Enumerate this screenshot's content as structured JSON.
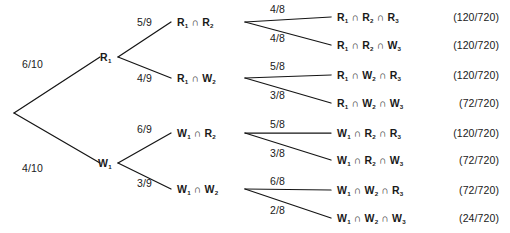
{
  "diagram": {
    "type": "probability-tree",
    "root": {
      "x": 14,
      "y": 113
    },
    "level1": [
      {
        "id": "R1",
        "label": "R",
        "subscript": "1",
        "prob": "6/10",
        "x": 100,
        "y": 57,
        "vertex_x": 118,
        "vertex_y": 57,
        "prob_x": 22,
        "prob_y": 64
      },
      {
        "id": "W1",
        "label": "W",
        "subscript": "1",
        "prob": "4/10",
        "x": 98,
        "y": 163,
        "vertex_x": 118,
        "vertex_y": 163,
        "prob_x": 22,
        "prob_y": 168
      }
    ],
    "level2": [
      {
        "id": "R1R2",
        "parent": "R1",
        "prob": "5/9",
        "prob_x": 137,
        "prob_y": 17,
        "x": 177,
        "y": 22,
        "vertex_x": 245,
        "vertex_y": 22,
        "terms": [
          {
            "letter": "R",
            "sub": "1"
          },
          {
            "letter": "R",
            "sub": "2"
          }
        ]
      },
      {
        "id": "R1W2",
        "parent": "R1",
        "prob": "4/9",
        "prob_x": 137,
        "prob_y": 73,
        "x": 177,
        "y": 78,
        "vertex_x": 245,
        "vertex_y": 78,
        "terms": [
          {
            "letter": "R",
            "sub": "1"
          },
          {
            "letter": "W",
            "sub": "2"
          }
        ]
      },
      {
        "id": "W1R2",
        "parent": "W1",
        "prob": "6/9",
        "prob_x": 137,
        "prob_y": 124,
        "x": 177,
        "y": 133,
        "vertex_x": 245,
        "vertex_y": 133,
        "terms": [
          {
            "letter": "W",
            "sub": "1"
          },
          {
            "letter": "R",
            "sub": "2"
          }
        ]
      },
      {
        "id": "W1W2",
        "parent": "W1",
        "prob": "3/9",
        "prob_x": 137,
        "prob_y": 178,
        "x": 177,
        "y": 189,
        "vertex_x": 245,
        "vertex_y": 189,
        "terms": [
          {
            "letter": "W",
            "sub": "1"
          },
          {
            "letter": "W",
            "sub": "2"
          }
        ]
      }
    ],
    "leaves": [
      {
        "id": "R1R2R3",
        "parent": "R1R2",
        "prob": "4/8",
        "prob_x": 270,
        "prob_y": 4,
        "y": 17,
        "outcome_x": 337,
        "prob_value": "(120/720)",
        "terms": [
          {
            "letter": "R",
            "sub": "1"
          },
          {
            "letter": "R",
            "sub": "2"
          },
          {
            "letter": "R",
            "sub": "3"
          }
        ]
      },
      {
        "id": "R1R2W3",
        "parent": "R1R2",
        "prob": "4/8",
        "prob_x": 270,
        "prob_y": 33,
        "y": 45,
        "outcome_x": 337,
        "prob_value": "(120/720)",
        "terms": [
          {
            "letter": "R",
            "sub": "1"
          },
          {
            "letter": "R",
            "sub": "2"
          },
          {
            "letter": "W",
            "sub": "3"
          }
        ]
      },
      {
        "id": "R1W2R3",
        "parent": "R1W2",
        "prob": "5/8",
        "prob_x": 270,
        "prob_y": 61,
        "y": 75,
        "outcome_x": 337,
        "prob_value": "(120/720)",
        "terms": [
          {
            "letter": "R",
            "sub": "1"
          },
          {
            "letter": "W",
            "sub": "2"
          },
          {
            "letter": "R",
            "sub": "3"
          }
        ]
      },
      {
        "id": "R1W2W3",
        "parent": "R1W2",
        "prob": "3/8",
        "prob_x": 270,
        "prob_y": 90,
        "y": 103,
        "outcome_x": 337,
        "prob_value": "(72/720)",
        "terms": [
          {
            "letter": "R",
            "sub": "1"
          },
          {
            "letter": "W",
            "sub": "2"
          },
          {
            "letter": "W",
            "sub": "3"
          }
        ]
      },
      {
        "id": "W1R2R3",
        "parent": "W1R2",
        "prob": "5/8",
        "prob_x": 270,
        "prob_y": 119,
        "y": 133,
        "outcome_x": 337,
        "prob_value": "(120/720)",
        "terms": [
          {
            "letter": "W",
            "sub": "1"
          },
          {
            "letter": "R",
            "sub": "2"
          },
          {
            "letter": "R",
            "sub": "3"
          }
        ]
      },
      {
        "id": "W1R2W3",
        "parent": "W1R2",
        "prob": "3/8",
        "prob_x": 270,
        "prob_y": 148,
        "y": 160,
        "outcome_x": 337,
        "prob_value": "(72/720)",
        "terms": [
          {
            "letter": "W",
            "sub": "1"
          },
          {
            "letter": "R",
            "sub": "2"
          },
          {
            "letter": "W",
            "sub": "3"
          }
        ]
      },
      {
        "id": "W1W2R3",
        "parent": "W1W2",
        "prob": "6/8",
        "prob_x": 270,
        "prob_y": 176,
        "y": 190,
        "outcome_x": 337,
        "prob_value": "(72/720)",
        "terms": [
          {
            "letter": "W",
            "sub": "1"
          },
          {
            "letter": "W",
            "sub": "2"
          },
          {
            "letter": "R",
            "sub": "3"
          }
        ]
      },
      {
        "id": "W1W2W3",
        "parent": "W1W2",
        "prob": "2/8",
        "prob_x": 270,
        "prob_y": 205,
        "y": 218,
        "outcome_x": 337,
        "prob_value": "(24/720)",
        "terms": [
          {
            "letter": "W",
            "sub": "1"
          },
          {
            "letter": "W",
            "sub": "2"
          },
          {
            "letter": "W",
            "sub": "3"
          }
        ]
      }
    ],
    "symbols": {
      "intersection": "∩"
    },
    "colors": {
      "line": "#151515",
      "text": "#1a1a1a",
      "background": "#ffffff"
    }
  }
}
